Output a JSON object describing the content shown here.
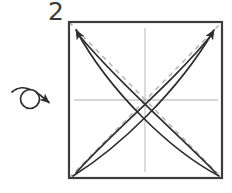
{
  "diagram": {
    "step_label": "2",
    "colors": {
      "frame": "#3c3c3c",
      "crease_dashed": "#b3b3b3",
      "center_line": "#c9c9c9",
      "arrow": "#2f2f2f",
      "background": "#ffffff",
      "step_text": "#3a3a3a"
    },
    "frame": {
      "name": "paper-square",
      "x": 69,
      "y": 22,
      "width": 153,
      "height": 156,
      "stroke_width": 2.2
    },
    "center_lines": [
      {
        "name": "vertical-center-line",
        "x1": 145,
        "y1": 28,
        "x2": 145,
        "y2": 172
      },
      {
        "name": "horizontal-center-line",
        "x1": 74,
        "y1": 100,
        "x2": 218,
        "y2": 100
      }
    ],
    "dashed_diagonals": [
      {
        "name": "diagonal-crease-tl-br",
        "x1": 69,
        "y1": 22,
        "x2": 222,
        "y2": 178
      },
      {
        "name": "diagonal-crease-bl-tr",
        "x1": 69,
        "y1": 178,
        "x2": 222,
        "y2": 22
      }
    ],
    "curved_arrows": [
      {
        "name": "arrow-bottom-right-to-top-left-outer",
        "path": "M 219 176 C 170 150 110 92 76 30",
        "arrowhead": true,
        "arrowhead_at": "end"
      },
      {
        "name": "arrow-bottom-right-to-top-left-inner",
        "path": "M 216 173 C 178 134 120 84 77 33",
        "arrowhead": false,
        "arrowhead_at": "end"
      },
      {
        "name": "arrow-bottom-left-to-top-right-outer",
        "path": "M 73 176 C 118 148 178 92 214 30",
        "arrowhead": true,
        "arrowhead_at": "end"
      },
      {
        "name": "arrow-bottom-left-to-top-right-inner",
        "path": "M 76 173 C 112 132 172 84 213 33",
        "arrowhead": false,
        "arrowhead_at": "end"
      }
    ],
    "turn_over_symbol": {
      "name": "turn-over-symbol",
      "circle": {
        "cx": 30,
        "cy": 99,
        "r": 9.5
      },
      "tail_path": "M 12 92 C 18 87 25 87 30 89.6",
      "head_path": "M 36 92 C 42 96 46 100 50 103",
      "arrow_tip": {
        "x": 51,
        "y": 104
      },
      "description": "flip-the-paper-over arrow"
    }
  }
}
